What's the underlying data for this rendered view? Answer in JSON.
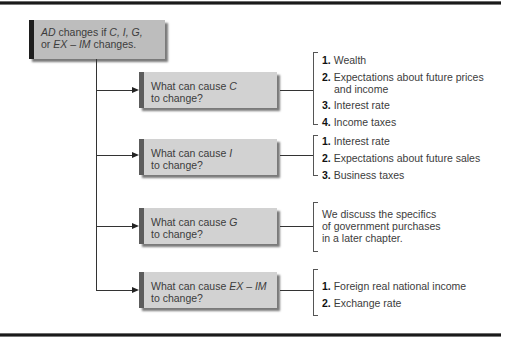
{
  "root": {
    "parts": [
      {
        "text": "AD",
        "italic": true
      },
      {
        "text": " changes if ",
        "italic": false
      },
      {
        "text": "C, I, G,",
        "italic": true
      },
      {
        "text": "\nor ",
        "italic": false
      },
      {
        "text": "EX – IM",
        "italic": true
      },
      {
        "text": " changes.",
        "italic": false
      }
    ]
  },
  "branches": [
    {
      "prefix": "What can cause ",
      "variable": "C",
      "suffix": "to change?",
      "items": [
        {
          "num": "1.",
          "text": "Wealth"
        },
        {
          "num": "2.",
          "text": "Expectations about future prices and income"
        },
        {
          "num": "3.",
          "text": "Interest rate"
        },
        {
          "num": "4.",
          "text": "Income taxes"
        }
      ]
    },
    {
      "prefix": "What can cause ",
      "variable": "I",
      "suffix": "to change?",
      "items": [
        {
          "num": "1.",
          "text": "Interest rate"
        },
        {
          "num": "2.",
          "text": "Expectations about future sales"
        },
        {
          "num": "3.",
          "text": "Business taxes"
        }
      ]
    },
    {
      "prefix": "What can cause ",
      "variable": "G",
      "suffix": "to change?",
      "note": "We discuss the specifics of government purchases in a later chapter."
    },
    {
      "prefix": "What can cause ",
      "variable": "EX – IM",
      "suffix": "to change?",
      "items": [
        {
          "num": "1.",
          "text": "Foreign real national income"
        },
        {
          "num": "2.",
          "text": "Exchange rate"
        }
      ]
    }
  ]
}
